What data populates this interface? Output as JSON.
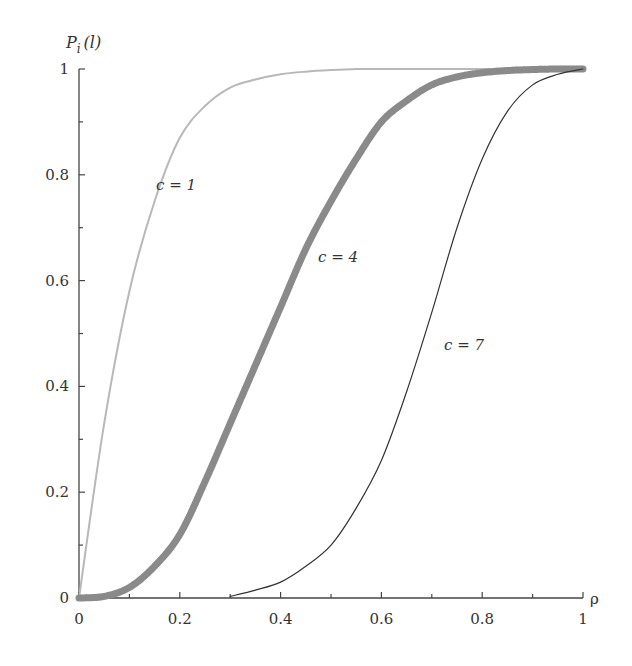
{
  "chart_data": {
    "type": "line",
    "title": "",
    "xlabel": "ρ",
    "ylabel": "P_i(l)",
    "xlim": [
      0,
      1
    ],
    "ylim": [
      0,
      1
    ],
    "grid": false,
    "legend": "inline curve labels",
    "x_ticks": [
      "0",
      "0.2",
      "0.4",
      "0.6",
      "0.8",
      "1"
    ],
    "y_ticks": [
      "0",
      "0.2",
      "0.4",
      "0.6",
      "0.8",
      "1"
    ],
    "x": [
      0,
      0.05,
      0.1,
      0.15,
      0.2,
      0.25,
      0.3,
      0.35,
      0.4,
      0.45,
      0.5,
      0.55,
      0.6,
      0.65,
      0.7,
      0.75,
      0.8,
      0.85,
      0.9,
      0.95,
      1.0
    ],
    "series": [
      {
        "name": "c = 1",
        "color": "#b8b8b8",
        "width": 2,
        "values": [
          0,
          0.33,
          0.58,
          0.75,
          0.87,
          0.93,
          0.965,
          0.98,
          0.99,
          0.995,
          0.998,
          1,
          1,
          1,
          1,
          1,
          1,
          1,
          1,
          1,
          1
        ]
      },
      {
        "name": "c = 4",
        "color": "#8a8a8a",
        "width": 7,
        "values": [
          0,
          0.003,
          0.02,
          0.06,
          0.12,
          0.22,
          0.33,
          0.44,
          0.55,
          0.66,
          0.75,
          0.83,
          0.9,
          0.94,
          0.97,
          0.985,
          0.993,
          0.997,
          0.999,
          1,
          1
        ]
      },
      {
        "name": "c = 7",
        "color": "#333333",
        "width": 1.2,
        "values": [
          null,
          null,
          null,
          null,
          null,
          null,
          0.003,
          0.015,
          0.03,
          0.06,
          0.1,
          0.17,
          0.26,
          0.39,
          0.54,
          0.7,
          0.83,
          0.92,
          0.97,
          0.99,
          1
        ]
      }
    ],
    "annotations": [
      {
        "text": "c = 1",
        "x": 0.16,
        "y": 0.79
      },
      {
        "text": "c = 4",
        "x": 0.47,
        "y": 0.645
      },
      {
        "text": "c = 7",
        "x": 0.72,
        "y": 0.5
      }
    ]
  },
  "axes": {
    "ylabel_main": "P",
    "ylabel_sub": "i",
    "ylabel_arg": "(l)",
    "xlabel": "ρ"
  },
  "labels": {
    "c1": "c = 1",
    "c4": "c = 4",
    "c7": "c = 7"
  }
}
